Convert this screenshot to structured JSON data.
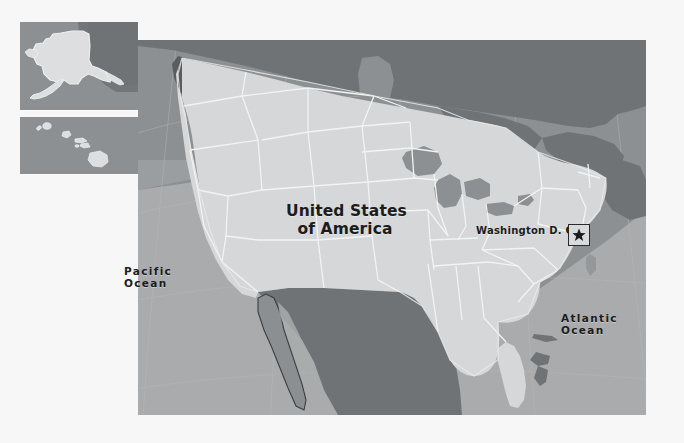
{
  "map": {
    "title": "United States of America",
    "type": "political-reference-map",
    "projection_note": "conic",
    "country_label": "United States\nof America",
    "country_label_line1": "United States",
    "country_label_line2": "of America",
    "capital": {
      "name": "Washington D. C.",
      "marker_icon": "star-icon"
    },
    "oceans": [
      {
        "name": "Pacific\nOcean",
        "line1": "Pacific",
        "line2": "Ocean"
      },
      {
        "name": "Atlantic\nOcean",
        "line1": "Atlantic",
        "line2": "Ocean"
      }
    ],
    "ocean_pacific_line1": "Pacific",
    "ocean_pacific_line2": "Ocean",
    "ocean_atlantic_line1": "Atlantic",
    "ocean_atlantic_line2": "Ocean",
    "insets": [
      {
        "name": "alaska-inset",
        "region": "Alaska"
      },
      {
        "name": "hawaii-inset",
        "region": "Hawaii"
      }
    ],
    "colors": {
      "page_background": "#f7f7f7",
      "ocean": "#8d9093",
      "ocean_light": "#a9abad",
      "united_states": "#d5d7d8",
      "neighbor_country": "#6f7376",
      "state_border": "#f2f3f3",
      "coastline": "#e9eaea",
      "label_text": "#1c1c1c",
      "marker_fill": "#d8dadb",
      "marker_border": "#2a2a2a"
    }
  }
}
